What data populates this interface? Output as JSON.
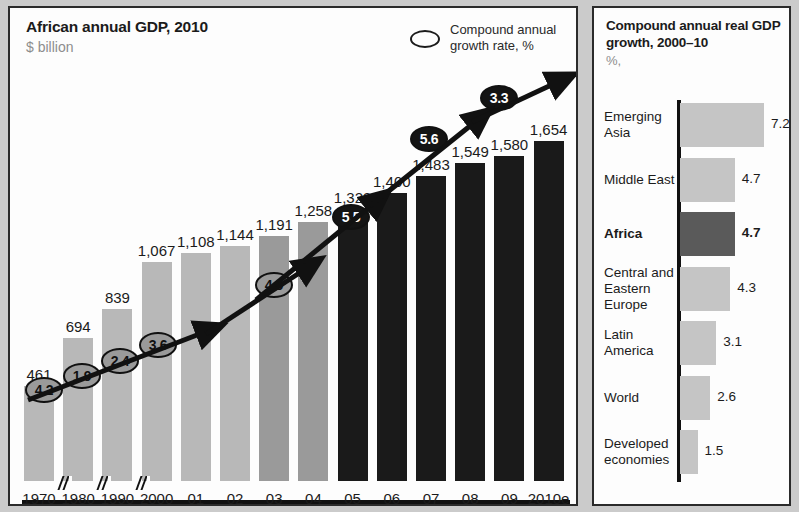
{
  "left": {
    "title": "African annual GDP, 2010",
    "subtitle": "$ billion",
    "legend": {
      "icon": "ellipse-outline-icon",
      "text": "Compound annual growth rate, %"
    }
  },
  "right": {
    "title": "Compound annual real GDP growth, 2000–10",
    "subtitle": "%,"
  },
  "chart_data": [
    {
      "id": "african-gdp",
      "type": "bar",
      "title": "African annual GDP, 2010",
      "subtitle": "$ billion",
      "xlabel": "",
      "ylabel": "$ billion",
      "ylim": [
        0,
        1654
      ],
      "grid": false,
      "axis_breaks": [
        "1970/1980",
        "1980/1990",
        "1990/2000"
      ],
      "categories": [
        "1970",
        "1980",
        "1990",
        "2000",
        "01",
        "02",
        "03",
        "04",
        "05",
        "06",
        "07",
        "08",
        "09",
        "2010e"
      ],
      "values": [
        461,
        694,
        839,
        1067,
        1108,
        1144,
        1191,
        1258,
        1323,
        1400,
        1483,
        1549,
        1580,
        1654
      ],
      "value_labels": [
        "461",
        "694",
        "839",
        "1,067",
        "1,108",
        "1,144",
        "1,191",
        "1,258",
        "1,323",
        "1,400",
        "1,483",
        "1,549",
        "1,580",
        "1,654"
      ],
      "bar_colors": [
        "#b8b8b8",
        "#b8b8b8",
        "#b8b8b8",
        "#b8b8b8",
        "#b8b8b8",
        "#b8b8b8",
        "#9a9a9a",
        "#9a9a9a",
        "#1a1a1a",
        "#1a1a1a",
        "#1a1a1a",
        "#1a1a1a",
        "#1a1a1a",
        "#1a1a1a"
      ],
      "overlay": {
        "type": "line",
        "name": "Compound annual growth rate, %",
        "labels": [
          "4.2",
          "1.9",
          "2.4",
          "3.6",
          "4.9",
          "5.5",
          "5.6",
          "3.3"
        ],
        "values": [
          4.2,
          1.9,
          2.4,
          3.6,
          4.9,
          5.5,
          5.6,
          3.3
        ],
        "periods": [
          "1970–80",
          "1980–90",
          "1990–2000",
          "2000–02",
          "2002–04",
          "2004–06",
          "2006–08",
          "2008–10"
        ],
        "styles": [
          "grey",
          "grey",
          "grey",
          "grey",
          "grey",
          "dark",
          "dark",
          "dark"
        ]
      }
    },
    {
      "id": "regional-growth",
      "type": "bar",
      "orientation": "horizontal",
      "title": "Compound annual real GDP growth, 2000–10",
      "subtitle": "%,",
      "xlabel": "%",
      "ylabel": "",
      "xlim": [
        0,
        7.2
      ],
      "grid": false,
      "categories": [
        "Emerging Asia",
        "Middle East",
        "Africa",
        "Central and Eastern Europe",
        "Latin America",
        "World",
        "Developed economies"
      ],
      "values": [
        7.2,
        4.7,
        4.7,
        4.3,
        3.1,
        2.6,
        1.5
      ],
      "value_labels": [
        "7.2",
        "4.7",
        "4.7",
        "4.3",
        "3.1",
        "2.6",
        "1.5"
      ],
      "highlight": "Africa",
      "bar_colors": [
        "#c5c5c5",
        "#c5c5c5",
        "#5a5a5a",
        "#c5c5c5",
        "#c5c5c5",
        "#c5c5c5",
        "#c5c5c5"
      ]
    }
  ],
  "colors": {
    "light_bar": "#b8b8b8",
    "mid_bar": "#9a9a9a",
    "dark_bar": "#1a1a1a",
    "highlight_bar": "#5a5a5a",
    "panel_border": "#2b2b2b",
    "text": "#1b1b1b",
    "muted_text": "#8d8d8d"
  }
}
